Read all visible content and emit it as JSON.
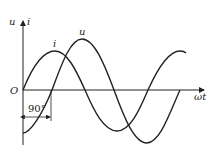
{
  "diagram": {
    "title": "",
    "axis_labels": {
      "y_left": "u",
      "y_right": "i",
      "x": "ωt",
      "origin": "O"
    },
    "curves": [
      {
        "name": "i",
        "label": "i",
        "shape": "sine",
        "amplitude_px": 40,
        "phase": "leads by 90°"
      },
      {
        "name": "u",
        "label": "u",
        "shape": "sine",
        "amplitude_px": 52,
        "phase": "reference"
      }
    ],
    "annotation": {
      "text": "90°",
      "meaning": "phase difference between i and u"
    },
    "colors": {
      "stroke": "#222222",
      "background": "#ffffff"
    }
  }
}
